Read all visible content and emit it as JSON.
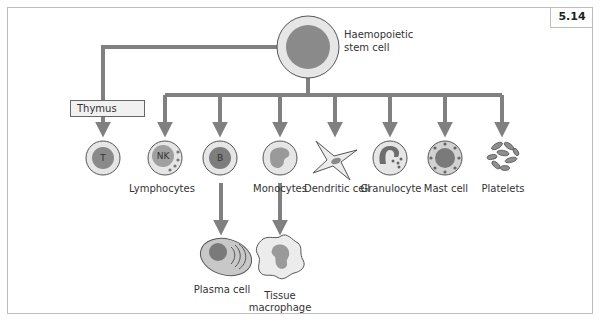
{
  "figure": {
    "number": "5.14",
    "root": {
      "label_line1": "Haemopoietic",
      "label_line2": "stem cell"
    },
    "thymus_label": "Thymus",
    "cells": [
      {
        "id": "t-cell",
        "nucleus_label": "T"
      },
      {
        "id": "nk-cell",
        "nucleus_label": "NK"
      },
      {
        "id": "b-cell",
        "nucleus_label": "B"
      },
      {
        "id": "monocyte"
      },
      {
        "id": "dendritic-cell"
      },
      {
        "id": "granulocyte"
      },
      {
        "id": "mast-cell"
      },
      {
        "id": "platelets"
      }
    ],
    "labels": {
      "lymphocytes": "Lymphocytes",
      "monocytes": "Monocytes",
      "dendritic": "Dendritic cell",
      "granulocyte": "Granulocyte",
      "mast": "Mast cell",
      "platelets": "Platelets",
      "plasma": "Plasma cell",
      "macrophage_line1": "Tissue",
      "macrophage_line2": "macrophage"
    },
    "colors": {
      "arrow": "#808080",
      "cell_outer": "#e6e6e6",
      "nucleus": "#8a8a8a",
      "outline": "#555555",
      "frame": "#bdbdbd"
    }
  }
}
